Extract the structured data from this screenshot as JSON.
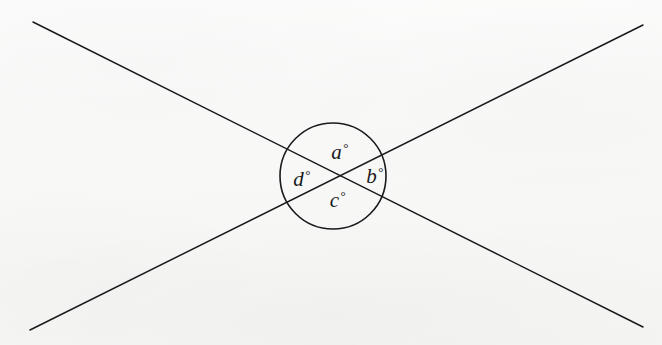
{
  "figure": {
    "name": "intersecting-lines-vertical-angles",
    "background_color": "#f7f7f6",
    "ink_color": "#1a1a1d",
    "canvas": {
      "width": 662,
      "height": 345
    },
    "intersection_point": {
      "x": 332,
      "y": 177
    },
    "circle": {
      "name": "angle-highlight-circle",
      "center_x": 333,
      "center_y": 176,
      "radius": 53,
      "stroke_width": 1.6,
      "fill": "none"
    },
    "lines": [
      {
        "name": "line-descending",
        "x1": 33,
        "y1": 22,
        "x2": 643,
        "y2": 327,
        "stroke_width": 1.5
      },
      {
        "name": "line-ascending",
        "x1": 30,
        "y1": 330,
        "x2": 643,
        "y2": 25,
        "stroke_width": 1.5
      }
    ],
    "labels": [
      {
        "id": "a",
        "letter": "a",
        "degree": "°",
        "position": "top",
        "x": 340,
        "y": 152
      },
      {
        "id": "b",
        "letter": "b",
        "degree": "°",
        "position": "right",
        "x": 375,
        "y": 176
      },
      {
        "id": "c",
        "letter": "c",
        "degree": "°",
        "position": "bottom",
        "x": 338,
        "y": 200
      },
      {
        "id": "d",
        "letter": "d",
        "degree": "°",
        "position": "left",
        "x": 302,
        "y": 179
      }
    ]
  }
}
